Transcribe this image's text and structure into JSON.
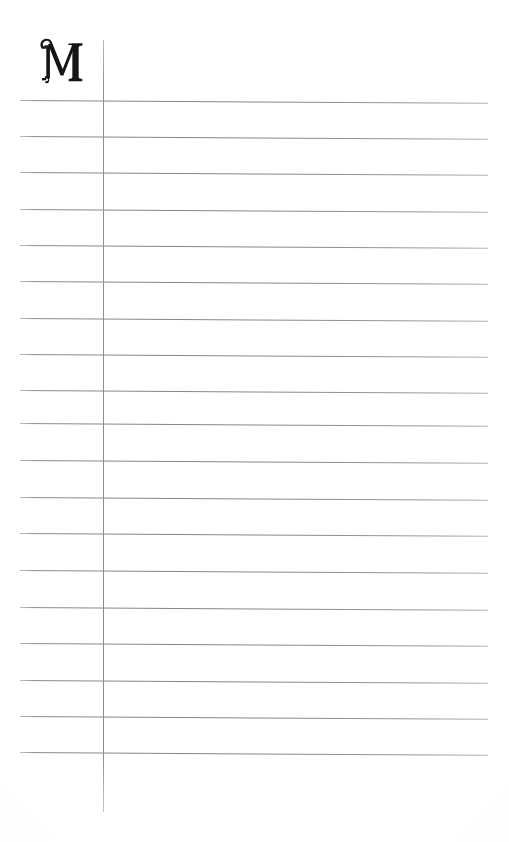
{
  "document": {
    "kind": "scanned-ruled-register-page",
    "page_width": 509,
    "page_height": 842,
    "background_color": "#fdfdfc",
    "ink_color": "#1a1a1a",
    "rule_color": "#8a8a8a"
  },
  "drop_cap": {
    "letter": "M",
    "style": "ornamental-serif-swash-initial",
    "color": "#151515",
    "left": 34,
    "top": 37,
    "width": 44,
    "height": 58
  },
  "column_rule": {
    "label": "vertical-column-divider",
    "x": 103,
    "top": 40,
    "bottom": 812,
    "color": "#8a8a8a",
    "width_px": 1
  },
  "ruled_lines": {
    "count": 19,
    "left": 20,
    "right": 488,
    "spacing": 36.4,
    "skew_degrees": 0.35,
    "color": "#8a8a8a",
    "y_positions": [
      99.5,
      136,
      172,
      208.5,
      245,
      281,
      317.5,
      354,
      390,
      423,
      460,
      497,
      533,
      570,
      607,
      643,
      680,
      716,
      752
    ]
  },
  "content": {
    "body_text": "",
    "note": "blank ruled page, no written entries"
  }
}
